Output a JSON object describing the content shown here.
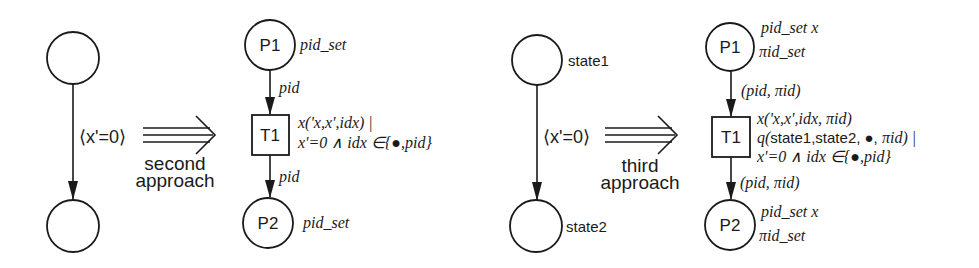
{
  "diagram": {
    "type": "petri-net-transformation",
    "panels": [
      {
        "id": "second",
        "source": {
          "places": [
            {
              "label": "",
              "annotation": ""
            },
            {
              "label": "",
              "annotation": ""
            }
          ],
          "arc_guard": "⟨x'=0⟩"
        },
        "transform_label_1": "second",
        "transform_label_2": "approach",
        "target": {
          "p1": {
            "label": "P1",
            "type": "pid_set"
          },
          "arc_in": "pid",
          "t1": {
            "label": "T1",
            "guard_line1": "x('x,x',idx) |",
            "guard_line2": "x'=0 ∧ idx ∈{●,pid}"
          },
          "arc_out": "pid",
          "p2": {
            "label": "P2",
            "type": "pid_set"
          }
        }
      },
      {
        "id": "third",
        "source": {
          "places": [
            {
              "label": "",
              "annotation": "state1"
            },
            {
              "label": "",
              "annotation": "state2"
            }
          ],
          "arc_guard": "⟨x'=0⟩"
        },
        "transform_label_1": "third",
        "transform_label_2": "approach",
        "target": {
          "p1": {
            "label": "P1",
            "type_line1": "pid_set x",
            "type_line2": "πid_set"
          },
          "arc_in": "(pid, πid)",
          "t1": {
            "label": "T1",
            "guard_line1": "x('x,x',idx, πid)",
            "guard_line2_pre": "q(",
            "guard_line2_states": "state1,state2, ●, ",
            "guard_line2_post": "πid) |",
            "guard_line3": "x'=0 ∧ idx ∈{●,pid}"
          },
          "arc_out": "(pid, πid)",
          "p2": {
            "label": "P2",
            "type_line1": "pid_set x",
            "type_line2": "πid_set"
          }
        }
      }
    ]
  }
}
